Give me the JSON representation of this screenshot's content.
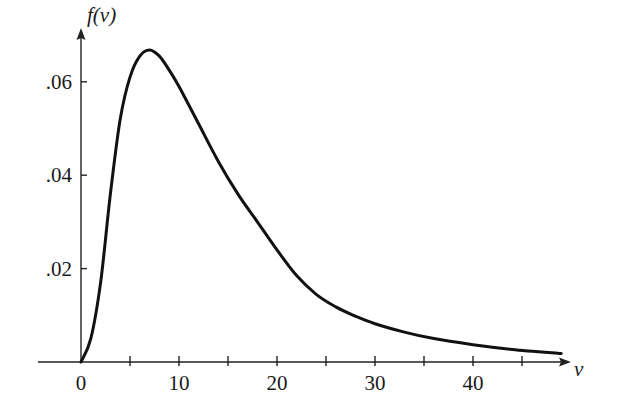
{
  "chart_data": {
    "type": "line",
    "title": "",
    "xlabel": "v",
    "ylabel": "f(v)",
    "xlim": [
      0,
      50
    ],
    "ylim": [
      0,
      0.07
    ],
    "grid": false,
    "legend": null,
    "x_ticks": [
      0,
      5,
      10,
      15,
      20,
      25,
      30,
      35,
      40,
      45
    ],
    "x_tick_labels": [
      {
        "value": 0,
        "label": "0"
      },
      {
        "value": 10,
        "label": "10"
      },
      {
        "value": 20,
        "label": "20"
      },
      {
        "value": 30,
        "label": "30"
      },
      {
        "value": 40,
        "label": "40"
      }
    ],
    "y_ticks": [
      0.02,
      0.04,
      0.06
    ],
    "y_tick_labels": [
      {
        "value": 0.02,
        "label": ".02"
      },
      {
        "value": 0.04,
        "label": ".04"
      },
      {
        "value": 0.06,
        "label": ".06"
      }
    ],
    "series": [
      {
        "name": "f(v)",
        "x": [
          0,
          1,
          2,
          3,
          4,
          5,
          6,
          7,
          8,
          9,
          10,
          12,
          14,
          16,
          18,
          20,
          22,
          24,
          26,
          28,
          30,
          33,
          36,
          40,
          44,
          49
        ],
        "y": [
          0,
          0.005,
          0.017,
          0.036,
          0.052,
          0.061,
          0.0655,
          0.0668,
          0.0655,
          0.0625,
          0.059,
          0.051,
          0.043,
          0.036,
          0.03,
          0.024,
          0.0185,
          0.0145,
          0.0118,
          0.0098,
          0.0082,
          0.0064,
          0.005,
          0.0037,
          0.0027,
          0.0018
        ]
      }
    ],
    "annotations": [],
    "peak": {
      "x": 7,
      "y": 0.0668
    }
  }
}
